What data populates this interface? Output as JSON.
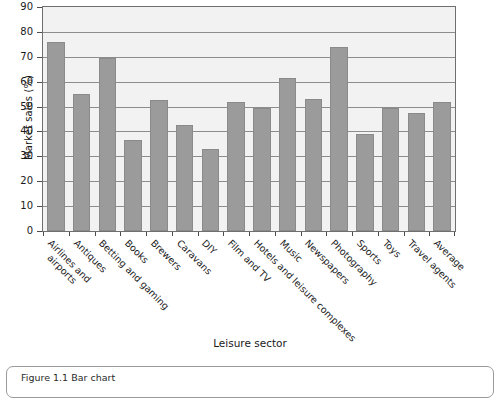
{
  "chart_data": {
    "type": "bar",
    "title": "",
    "xlabel": "Leisure sector",
    "ylabel": "Market sales (%)",
    "ylim": [
      0,
      90
    ],
    "ytick_step": 10,
    "yticks": [
      0,
      10,
      20,
      30,
      40,
      50,
      60,
      70,
      80,
      90
    ],
    "grid": true,
    "legend": "none",
    "bar_color": "#9b9b9b",
    "plot_background": "#f2f2f2",
    "categories": [
      "Airlines and airports",
      "Antiques",
      "Betting and gaming",
      "Books",
      "Brewers",
      "Caravans",
      "DIY",
      "Film and TV",
      "Hotels and leisure complexes",
      "Music",
      "Newspapers",
      "Photography",
      "Sports",
      "Toys",
      "Travel agents",
      "Average"
    ],
    "values": [
      76,
      55,
      69.5,
      36.5,
      52.5,
      42.5,
      33,
      52,
      49.5,
      61.5,
      53,
      74,
      39,
      49.5,
      47.5,
      52
    ]
  },
  "caption": {
    "text": "Figure 1.1  Bar chart"
  }
}
